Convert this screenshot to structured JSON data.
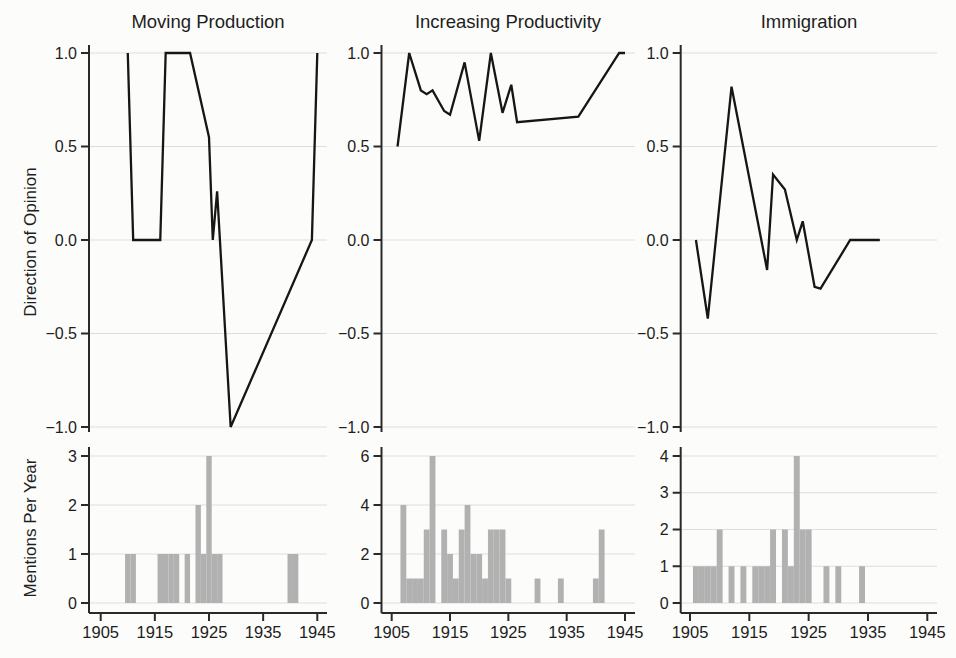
{
  "figure": {
    "row_labels": [
      "Direction of Opinion",
      "Mentions Per Year"
    ],
    "columns": [
      "Moving Production",
      "Increasing Productivity",
      "Immigration"
    ],
    "x_tick_labels": [
      "1905",
      "1915",
      "1925",
      "1935",
      "1945"
    ],
    "colors": {
      "line": "#161616",
      "bar": "#b1b1b1",
      "axis": "#2a2a2a",
      "gridline": "#dededc",
      "background": "#fcfcfa"
    }
  },
  "chart_data": [
    {
      "id": "moving-production-direction",
      "type": "line",
      "title": "Moving Production",
      "ylabel": "Direction of Opinion",
      "ylim": [
        -1.0,
        1.0
      ],
      "yticks": [
        1.0,
        0.5,
        0.0,
        -0.5,
        -1.0
      ],
      "xlim": [
        1903,
        1947
      ],
      "xticks": [
        1905,
        1915,
        1925,
        1935,
        1945
      ],
      "grid": true,
      "line_color": "#161616",
      "points": [
        [
          1910,
          1.0
        ],
        [
          1911,
          0.0
        ],
        [
          1916,
          0.0
        ],
        [
          1917,
          1.0
        ],
        [
          1921.5,
          1.0
        ],
        [
          1925,
          0.55
        ],
        [
          1925.7,
          0.0
        ],
        [
          1926.5,
          0.26
        ],
        [
          1929,
          -1.0
        ],
        [
          1944,
          0.0
        ],
        [
          1945,
          1.0
        ]
      ]
    },
    {
      "id": "increasing-productivity-direction",
      "type": "line",
      "title": "Increasing Productivity",
      "ylabel": "Direction of Opinion",
      "ylim": [
        -1.0,
        1.0
      ],
      "yticks": [
        1.0,
        0.5,
        0.0,
        -0.5,
        -1.0
      ],
      "xlim": [
        1903,
        1947
      ],
      "xticks": [
        1905,
        1915,
        1925,
        1935,
        1945
      ],
      "grid": true,
      "line_color": "#161616",
      "points": [
        [
          1906,
          0.5
        ],
        [
          1908,
          1.0
        ],
        [
          1910,
          0.8
        ],
        [
          1911,
          0.78
        ],
        [
          1912,
          0.8
        ],
        [
          1914,
          0.69
        ],
        [
          1915,
          0.67
        ],
        [
          1917.5,
          0.95
        ],
        [
          1920,
          0.53
        ],
        [
          1922,
          1.0
        ],
        [
          1924,
          0.68
        ],
        [
          1925.5,
          0.83
        ],
        [
          1926.5,
          0.63
        ],
        [
          1937,
          0.66
        ],
        [
          1944,
          1.0
        ],
        [
          1945,
          1.0
        ]
      ]
    },
    {
      "id": "immigration-direction",
      "type": "line",
      "title": "Immigration",
      "ylabel": "Direction of Opinion",
      "ylim": [
        -1.0,
        1.0
      ],
      "yticks": [
        1.0,
        0.5,
        0.0,
        -0.5,
        -1.0
      ],
      "xlim": [
        1903,
        1947
      ],
      "xticks": [
        1905,
        1915,
        1925,
        1935,
        1945
      ],
      "grid": true,
      "line_color": "#161616",
      "points": [
        [
          1906,
          0.0
        ],
        [
          1908,
          -0.42
        ],
        [
          1912,
          0.82
        ],
        [
          1918,
          -0.16
        ],
        [
          1919,
          0.35
        ],
        [
          1921,
          0.27
        ],
        [
          1923,
          0.0
        ],
        [
          1924,
          0.1
        ],
        [
          1926,
          -0.25
        ],
        [
          1927,
          -0.26
        ],
        [
          1932,
          0.0
        ],
        [
          1937,
          0.0
        ]
      ]
    },
    {
      "id": "moving-production-mentions",
      "type": "bar",
      "title": "Moving Production",
      "ylabel": "Mentions Per Year",
      "ylim": [
        0,
        3
      ],
      "yticks": [
        0,
        1,
        2,
        3
      ],
      "xlim": [
        1903,
        1947
      ],
      "xticks": [
        1905,
        1915,
        1925,
        1935,
        1945
      ],
      "grid": true,
      "bar_color": "#b1b1b1",
      "bars": [
        [
          1910,
          1
        ],
        [
          1911,
          1
        ],
        [
          1916,
          1
        ],
        [
          1917,
          1
        ],
        [
          1918,
          1
        ],
        [
          1919,
          1
        ],
        [
          1921,
          1
        ],
        [
          1923,
          2
        ],
        [
          1924,
          1
        ],
        [
          1925,
          3
        ],
        [
          1926,
          1
        ],
        [
          1927,
          1
        ],
        [
          1940,
          1
        ],
        [
          1941,
          1
        ]
      ]
    },
    {
      "id": "increasing-productivity-mentions",
      "type": "bar",
      "title": "Increasing Productivity",
      "ylabel": "Mentions Per Year",
      "ylim": [
        0,
        6
      ],
      "yticks": [
        0,
        2,
        4,
        6
      ],
      "xlim": [
        1903,
        1947
      ],
      "xticks": [
        1905,
        1915,
        1925,
        1935,
        1945
      ],
      "grid": true,
      "bar_color": "#b1b1b1",
      "bars": [
        [
          1907,
          4
        ],
        [
          1908,
          1
        ],
        [
          1909,
          1
        ],
        [
          1910,
          1
        ],
        [
          1911,
          3
        ],
        [
          1912,
          6
        ],
        [
          1914,
          3
        ],
        [
          1915,
          2
        ],
        [
          1916,
          1
        ],
        [
          1917,
          3
        ],
        [
          1918,
          4
        ],
        [
          1919,
          2
        ],
        [
          1920,
          2
        ],
        [
          1921,
          1
        ],
        [
          1922,
          3
        ],
        [
          1923,
          3
        ],
        [
          1924,
          3
        ],
        [
          1925,
          1
        ],
        [
          1930,
          1
        ],
        [
          1934,
          1
        ],
        [
          1940,
          1
        ],
        [
          1941,
          3
        ]
      ]
    },
    {
      "id": "immigration-mentions",
      "type": "bar",
      "title": "Immigration",
      "ylabel": "Mentions Per Year",
      "ylim": [
        0,
        4
      ],
      "yticks": [
        0,
        1,
        2,
        3,
        4
      ],
      "xlim": [
        1903,
        1947
      ],
      "xticks": [
        1905,
        1915,
        1925,
        1935,
        1945
      ],
      "grid": true,
      "bar_color": "#b1b1b1",
      "bars": [
        [
          1906,
          1
        ],
        [
          1907,
          1
        ],
        [
          1908,
          1
        ],
        [
          1909,
          1
        ],
        [
          1910,
          2
        ],
        [
          1912,
          1
        ],
        [
          1914,
          1
        ],
        [
          1916,
          1
        ],
        [
          1917,
          1
        ],
        [
          1918,
          1
        ],
        [
          1919,
          2
        ],
        [
          1921,
          2
        ],
        [
          1922,
          1
        ],
        [
          1923,
          4
        ],
        [
          1924,
          2
        ],
        [
          1925,
          2
        ],
        [
          1928,
          1
        ],
        [
          1930,
          1
        ],
        [
          1934,
          1
        ]
      ]
    }
  ]
}
